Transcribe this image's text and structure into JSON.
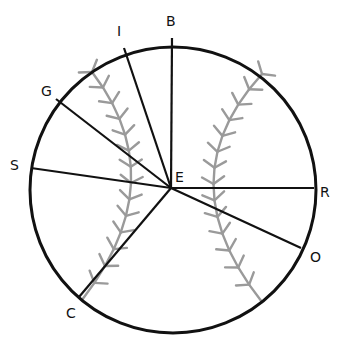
{
  "diagram": {
    "type": "circle-sector-diagram",
    "center": {
      "label": "E",
      "x": 171,
      "y": 188
    },
    "circle": {
      "cx": 173,
      "cy": 190,
      "r": 143
    },
    "colors": {
      "outline": "#111111",
      "radii": "#111111",
      "stitching": "#9a9a9a",
      "background": "#ffffff"
    },
    "points": [
      {
        "label": "B",
        "x": 172,
        "y": 38,
        "lx": 166,
        "ly": 26
      },
      {
        "label": "I",
        "x": 124,
        "y": 48,
        "lx": 117,
        "ly": 36
      },
      {
        "label": "G",
        "x": 56,
        "y": 99,
        "lx": 41,
        "ly": 96
      },
      {
        "label": "S",
        "x": 31,
        "y": 168,
        "lx": 10,
        "ly": 170
      },
      {
        "label": "R",
        "x": 314,
        "y": 188,
        "lx": 320,
        "ly": 197
      },
      {
        "label": "O",
        "x": 301,
        "y": 248,
        "lx": 310,
        "ly": 262
      },
      {
        "label": "C",
        "x": 79,
        "y": 297,
        "lx": 66,
        "ly": 318
      }
    ],
    "center_label": {
      "text": "E",
      "x": 175,
      "y": 182
    }
  }
}
